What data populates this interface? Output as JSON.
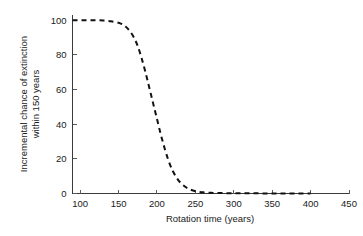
{
  "chart_data": {
    "type": "line",
    "title": "",
    "xlabel": "Rotation time (years)",
    "ylabel": "Incremental chance of extinction within 150 years",
    "ylabel_line1": "Incremental chance of extinction",
    "ylabel_line2": "within 150 years",
    "xlim": [
      90,
      450
    ],
    "ylim": [
      0,
      103
    ],
    "xticks": [
      100,
      150,
      200,
      250,
      300,
      350,
      400,
      450
    ],
    "yticks": [
      0,
      20,
      40,
      60,
      80,
      100
    ],
    "xtick_labels": [
      "100",
      "150",
      "200",
      "250",
      "300",
      "350",
      "400",
      "450"
    ],
    "ytick_labels": [
      "0",
      "20",
      "40",
      "60",
      "80",
      "100"
    ],
    "grid": false,
    "legend": "none",
    "series": [
      {
        "name": "Incremental chance of extinction",
        "linestyle": "dashed",
        "color": "#111111",
        "x": [
          90,
          100,
          110,
          120,
          130,
          140,
          150,
          155,
          160,
          165,
          170,
          175,
          180,
          185,
          190,
          195,
          200,
          205,
          210,
          215,
          220,
          225,
          230,
          235,
          240,
          245,
          250,
          260,
          270,
          280,
          290,
          300,
          310,
          320,
          330,
          340,
          350,
          360,
          370,
          380,
          390,
          400
        ],
        "y": [
          100,
          100,
          100,
          100,
          99.8,
          99.4,
          98.5,
          97.5,
          96,
          93.5,
          90,
          85,
          78,
          70,
          61,
          52,
          43,
          34,
          26,
          19,
          13.5,
          9.5,
          6.5,
          4.5,
          3,
          2,
          1.3,
          0.7,
          0.4,
          0.3,
          0.2,
          0.15,
          0.1,
          0.1,
          0.08,
          0.06,
          0.05,
          0.04,
          0.03,
          0.02,
          0.02,
          0.01
        ]
      }
    ]
  },
  "axes": {
    "x_title": "Rotation time (years)",
    "y_title_line1": "Incremental chance of extinction",
    "y_title_line2": "within 150 years"
  }
}
